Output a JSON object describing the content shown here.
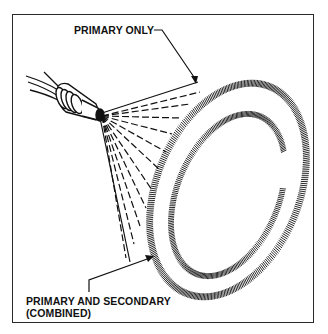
{
  "diagram": {
    "labels": {
      "primary_only": "PRIMARY ONLY",
      "combined_line1": "PRIMARY AND SECONDARY",
      "combined_line2": "(COMBINED)"
    },
    "colors": {
      "ink": "#111111",
      "background": "#ffffff",
      "frame": "#2a2a2a"
    }
  }
}
